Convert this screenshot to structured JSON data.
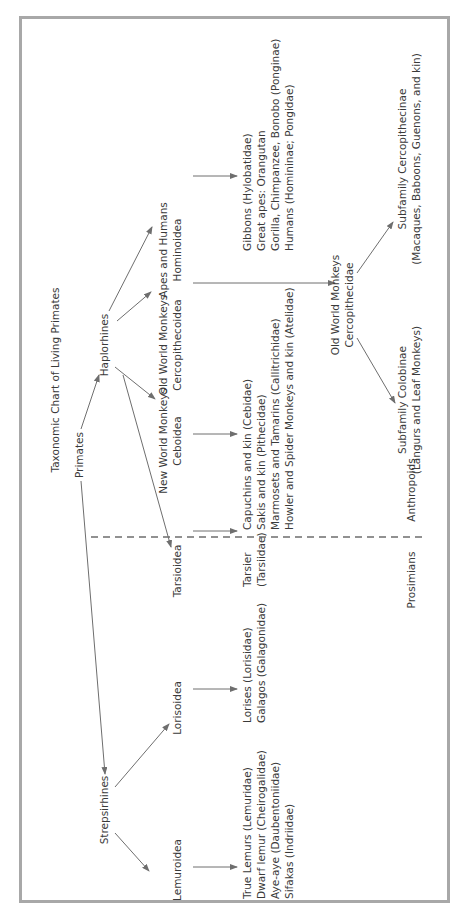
{
  "title": "Taxonomic Chart of Living Primates",
  "root": "Primates",
  "suborders": {
    "haplorhines": "Haplorhines",
    "strepsirhines": "Strepsirhines"
  },
  "superfamilies": {
    "hominoidea": {
      "line1": "Apes and Humans",
      "line2": "Hominoidea"
    },
    "cercopithecoidea": {
      "line1": "Old World Monkeys",
      "line2": "Cercopithecoidea"
    },
    "ceboidea": {
      "line1": "New World Monkeys",
      "line2": "Ceboidea"
    },
    "tarsioidea": {
      "line1": "Tarsioidea"
    },
    "lorisoidea": {
      "line1": "Lorisoidea"
    },
    "lemuroidea": {
      "line1": "Lemuroidea"
    }
  },
  "families": {
    "hominoidea": [
      "Gibbons (Hylobatidae)",
      "Great apes: Orangutan",
      "Gorilla, Chimpanzee, Bonobo (Ponginae)",
      "Humans (Homininae; Pongidae)"
    ],
    "cercopithecidae": {
      "line1": "Old World Monkeys",
      "line2": "Cercopithecidae"
    },
    "ceboidea": [
      "Capuchins and kin (Cebidae)",
      "Sakis and kin (Pithecidae)",
      "Marmosets and Tamarins (Callitrichidae)",
      "Howler and Spider Monkeys and kin (Atelidae)"
    ],
    "tarsioidea": [
      "Tarsier",
      "(Tarsiidae)"
    ],
    "lorisoidea": [
      "Lorises (Lorisidae)",
      "Galagos (Galagonidae)"
    ],
    "lemuroidea": [
      "True Lemurs (Lemuridae)",
      "Dwarf lemur (Cheirogalidae)",
      "Aye-aye (Daubentoniidae)",
      "Sifakas (Indriidae)"
    ]
  },
  "subfamilies": {
    "colobinae": {
      "line1": "Subfamily Colobinae",
      "line2": "(Langurs and Leaf Monkeys)"
    },
    "cercopithecinae": {
      "line1": "Subfamily Cercopithecinae",
      "line2": "(Macaques, Baboons, Guenons, and kin)"
    }
  },
  "groups": {
    "anthropoids": "Anthropoids",
    "prosimians": "Prosimians"
  },
  "colors": {
    "border": "#a8a8a8",
    "lines": "#6e6e6e",
    "text": "#3a3a3a",
    "background": "#ffffff"
  }
}
